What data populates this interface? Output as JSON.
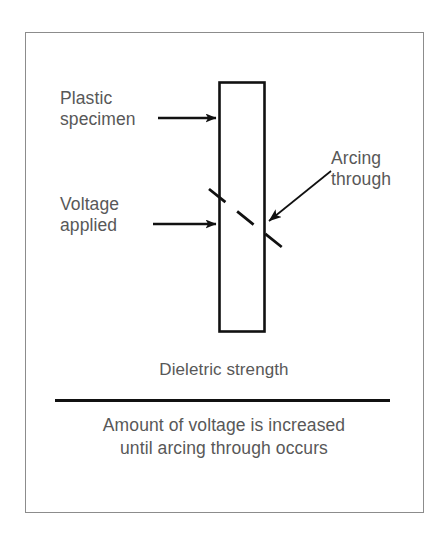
{
  "figure": {
    "kind": "technical-diagram",
    "background_color": "#ffffff",
    "frame_color": "#8c8c8c",
    "ink_color": "#111111",
    "text_color": "#585858"
  },
  "labels": {
    "plastic_specimen": "Plastic\nspecimen",
    "voltage_applied": "Voltage\napplied",
    "arcing_through": "Arcing\nthrough"
  },
  "captions": {
    "title": "Dieletric strength",
    "description": "Amount of voltage is increased\nuntil arcing through occurs"
  },
  "parts": {
    "specimen_bar": "plastic-specimen-bar",
    "arc_path": "arcing-through-dashed-line",
    "divider": "horizontal-rule"
  },
  "icons": {
    "specimen_arrow": "arrow-right-icon",
    "voltage_arrow": "arrow-right-icon",
    "arcing_arrow": "arrow-down-left-icon"
  }
}
